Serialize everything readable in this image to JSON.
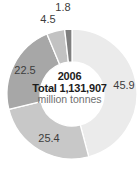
{
  "chart_data": {
    "type": "pie",
    "subtype": "donut",
    "title": "",
    "center_label": {
      "year": "2006",
      "total_line": "Total 1,131,907",
      "unit_line": "million tonnes"
    },
    "total_value": 1131907,
    "unit": "million tonnes",
    "direction": "clockwise",
    "start_angle_deg": 0,
    "legend": "none",
    "segments": [
      {
        "label": "45.9",
        "value": 45.9,
        "color": "#ebebeb",
        "label_x": 124,
        "label_y": 85
      },
      {
        "label": "25.4",
        "value": 25.4,
        "color": "#c8c8c8",
        "label_x": 49,
        "label_y": 138
      },
      {
        "label": "22.5",
        "value": 22.5,
        "color": "#a7a7a7",
        "label_x": 25,
        "label_y": 70
      },
      {
        "label": "4.5",
        "value": 4.5,
        "color": "#c2c2c2",
        "label_x": 48,
        "label_y": 19
      },
      {
        "label": "1.8",
        "value": 1.8,
        "color": "#7f7f7f",
        "label_x": 63,
        "label_y": 7
      }
    ],
    "geometry": {
      "cx": 72,
      "cy": 94,
      "outer_r": 65,
      "inner_r": 32,
      "separator_color": "#ffffff",
      "separator_width": 1.3,
      "background": "#ffffff",
      "label_color": "#3d3d3d"
    }
  }
}
